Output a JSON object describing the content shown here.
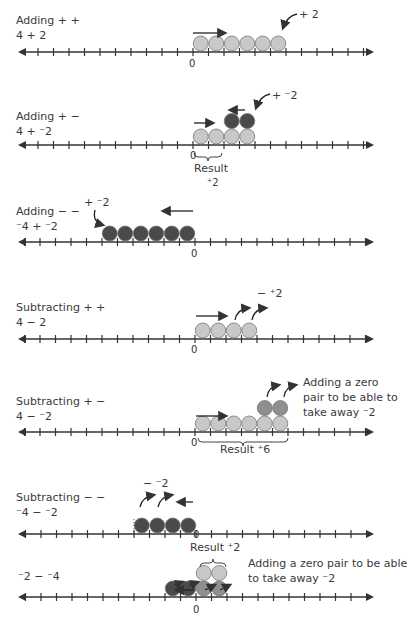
{
  "panels": [
    {
      "title": "Adding + +",
      "expr": "4 + 2",
      "annotation": "+ 2",
      "zero": "0"
    },
    {
      "title": "Adding + −",
      "expr": "4 + ⁻2",
      "annotation": "+ ⁻2",
      "zero": "0",
      "result_label": "Result",
      "result_value": "⁺2"
    },
    {
      "title": "Adding − −",
      "expr": "⁻4 + ⁻2",
      "annotation": "+ ⁻2",
      "zero": "0"
    },
    {
      "title": "Subtracting + +",
      "expr": "4 − 2",
      "annotation": "− ⁺2",
      "zero": "0"
    },
    {
      "title": "Subtracting + −",
      "expr": "4 − ⁻2",
      "annotation_lines": [
        "Adding a zero",
        "pair to be able to",
        "take away ⁻2"
      ],
      "zero": "0",
      "result_label": "Result ⁺6"
    },
    {
      "title": "Subtracting − −",
      "expr": "⁻4 − ⁻2",
      "annotation": "− ⁻2",
      "zero": "0"
    },
    {
      "expr": "⁻2 − ⁻4",
      "annotation_lines": [
        "Adding a zero pair to be able",
        "to  take away ⁻2"
      ],
      "zero": "0",
      "result_label": "Result ⁺2"
    }
  ],
  "colors": {
    "positive": "#c8c8c8",
    "negative": "#4a4a4a",
    "zero_pair_negative": "#8f8f8f",
    "axis": "#333333"
  }
}
